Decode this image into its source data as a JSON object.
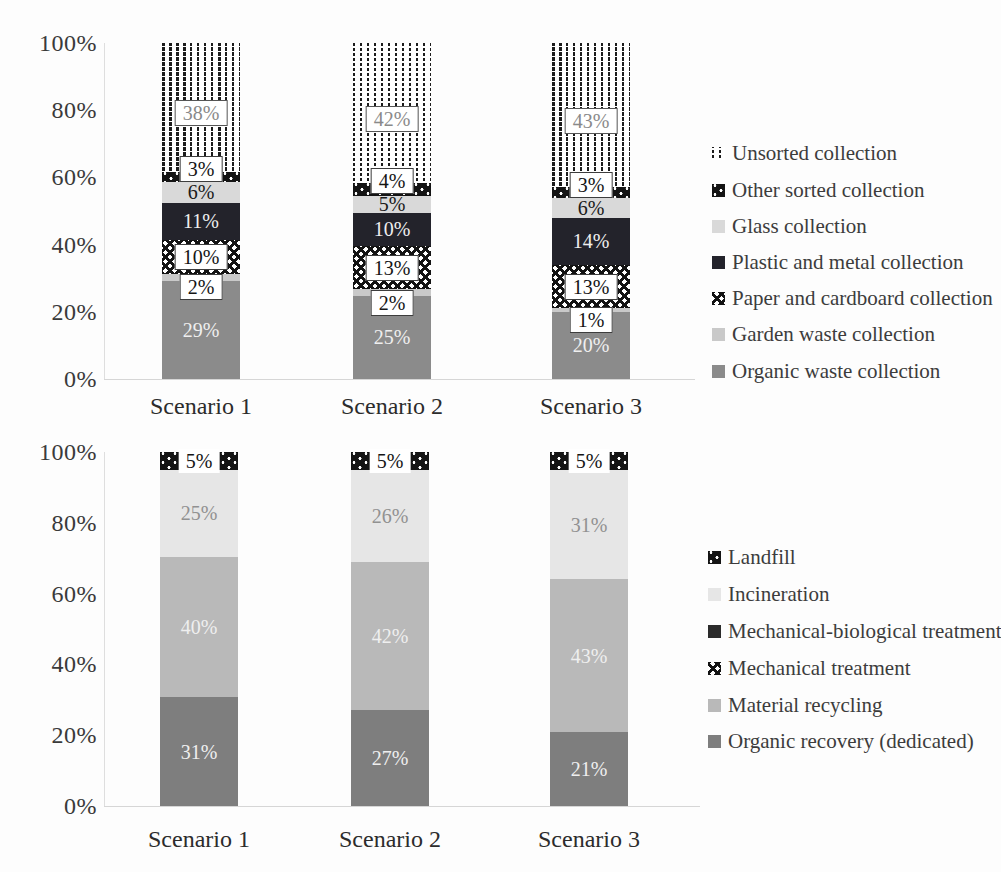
{
  "figure_background": "#fdfdfd",
  "chart_data": [
    {
      "id": "collection",
      "type": "bar",
      "stacked": true,
      "title": "",
      "xlabel": "",
      "ylabel": "",
      "ylim": [
        0,
        100
      ],
      "grid": false,
      "legend_position": "right",
      "y_ticks": [
        "100%",
        "80%",
        "60%",
        "40%",
        "20%",
        "0%"
      ],
      "categories": [
        "Scenario 1",
        "Scenario 2",
        "Scenario 3"
      ],
      "series": [
        {
          "name": "Organic waste collection",
          "values": [
            29,
            25,
            20
          ],
          "data_labels": [
            "29%",
            "25%",
            "20%"
          ],
          "fill": {
            "color": "#8b8b8b"
          },
          "label_style": "light",
          "label_dy": 0
        },
        {
          "name": "Garden waste collection",
          "values": [
            2,
            2,
            1
          ],
          "data_labels": [
            "2%",
            "2%",
            "1%"
          ],
          "fill": {
            "color": "#c9c9c9"
          },
          "label_style": "box",
          "label_dy": 10
        },
        {
          "name": "Paper and cardboard collection",
          "values": [
            10,
            13,
            13
          ],
          "data_labels": [
            "10%",
            "13%",
            "13%"
          ],
          "fill": {
            "pattern": "crosshatch"
          },
          "label_style": "box",
          "label_dy": 0
        },
        {
          "name": "Plastic and metal collection",
          "values": [
            11,
            10,
            14
          ],
          "data_labels": [
            "11%",
            "10%",
            "14%"
          ],
          "fill": {
            "color": "#23232b"
          },
          "label_style": "light",
          "label_dy": 0
        },
        {
          "name": "Glass collection",
          "values": [
            6,
            5,
            6
          ],
          "data_labels": [
            "6%",
            "5%",
            "6%"
          ],
          "fill": {
            "color": "#d9d9d9"
          },
          "label_style": "dark",
          "label_dy": 0
        },
        {
          "name": "Other sorted collection",
          "values": [
            3,
            4,
            3
          ],
          "data_labels": [
            "3%",
            "4%",
            "3%"
          ],
          "fill": {
            "pattern": "black-dots"
          },
          "label_style": "box",
          "label_dy": -8
        },
        {
          "name": "Unsorted collection",
          "values": [
            38,
            42,
            43
          ],
          "data_labels": [
            "38%",
            "42%",
            "43%"
          ],
          "fill": {
            "pattern": "dot-columns"
          },
          "label_style": "boxgray",
          "label_dy": 6
        }
      ],
      "legend": [
        {
          "label": "Unsorted collection",
          "fill": {
            "pattern": "dot-columns"
          }
        },
        {
          "label": "Other sorted collection",
          "fill": {
            "pattern": "black-dots"
          }
        },
        {
          "label": "Glass collection",
          "fill": {
            "color": "#d9d9d9"
          }
        },
        {
          "label": "Plastic and metal collection",
          "fill": {
            "color": "#23232b"
          }
        },
        {
          "label": "Paper and cardboard collection",
          "fill": {
            "pattern": "crosshatch"
          }
        },
        {
          "label": "Garden waste collection",
          "fill": {
            "color": "#c9c9c9"
          }
        },
        {
          "label": "Organic waste collection",
          "fill": {
            "color": "#8b8b8b"
          }
        }
      ]
    },
    {
      "id": "treatment",
      "type": "bar",
      "stacked": true,
      "title": "",
      "xlabel": "",
      "ylabel": "",
      "ylim": [
        0,
        100
      ],
      "grid": false,
      "legend_position": "right",
      "y_ticks": [
        "100%",
        "80%",
        "60%",
        "40%",
        "20%",
        "0%"
      ],
      "categories": [
        "Scenario 1",
        "Scenario 2",
        "Scenario 3"
      ],
      "series": [
        {
          "name": "Organic recovery (dedicated)",
          "values": [
            31,
            27,
            21
          ],
          "data_labels": [
            "31%",
            "27%",
            "21%"
          ],
          "fill": {
            "color": "#7e7e7e"
          },
          "label_style": "light",
          "label_dy": 0
        },
        {
          "name": "Material recycling",
          "values": [
            40,
            42,
            43
          ],
          "data_labels": [
            "40%",
            "42%",
            "43%"
          ],
          "fill": {
            "color": "#b9b9b9"
          },
          "label_style": "light",
          "label_dy": 0
        },
        {
          "name": "Mechanical treatment",
          "values": [
            0,
            0,
            0
          ],
          "data_labels": [
            "",
            "",
            ""
          ],
          "fill": {
            "pattern": "crosshatch"
          },
          "label_style": "dark",
          "label_dy": 0
        },
        {
          "name": "Mechanical-biological treatment",
          "values": [
            0,
            0,
            0
          ],
          "data_labels": [
            "",
            "",
            ""
          ],
          "fill": {
            "color": "#2b2b2b"
          },
          "label_style": "light",
          "label_dy": 0
        },
        {
          "name": "Incineration",
          "values": [
            25,
            26,
            31
          ],
          "data_labels": [
            "25%",
            "26%",
            "31%"
          ],
          "fill": {
            "color": "#e6e6e6"
          },
          "label_style": "gray",
          "label_dy": 0
        },
        {
          "name": "Landfill",
          "values": [
            5,
            5,
            5
          ],
          "data_labels": [
            "5%",
            "5%",
            "5%"
          ],
          "fill": {
            "pattern": "black-dots"
          },
          "label_style": "boxplain",
          "label_dy": 0
        }
      ],
      "legend": [
        {
          "label": "Landfill",
          "fill": {
            "pattern": "black-dots"
          }
        },
        {
          "label": "Incineration",
          "fill": {
            "color": "#e6e6e6"
          }
        },
        {
          "label": "Mechanical-biological treatment",
          "fill": {
            "color": "#2b2b2b"
          }
        },
        {
          "label": "Mechanical treatment",
          "fill": {
            "pattern": "crosshatch"
          }
        },
        {
          "label": "Material recycling",
          "fill": {
            "color": "#b9b9b9"
          }
        },
        {
          "label": "Organic recovery (dedicated)",
          "fill": {
            "color": "#7e7e7e"
          }
        }
      ]
    }
  ]
}
